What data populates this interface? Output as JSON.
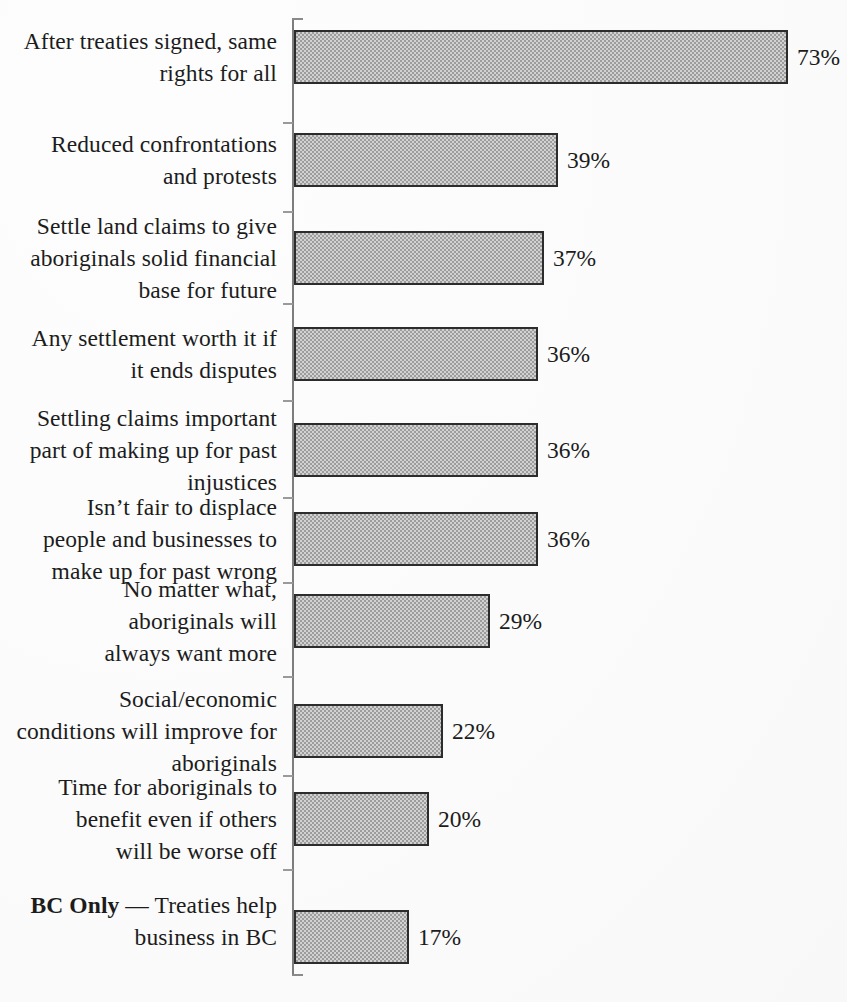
{
  "chart_data": {
    "type": "bar",
    "orientation": "horizontal",
    "title": "",
    "xlabel": "",
    "ylabel": "",
    "xlim": [
      0,
      80
    ],
    "grid": false,
    "legend": false,
    "value_suffix": "%",
    "categories": [
      "After treaties signed, same rights for all",
      "Reduced confrontations and protests",
      "Settle land claims to give aboriginals solid financial base for future",
      "Any settlement worth it if it ends disputes",
      "Settling claims important part of making up for past injustices",
      "Isn’t fair to displace people and businesses to make up for past wrong",
      "No matter what, aboriginals will always want more",
      "Social/economic conditions will improve for aboriginals",
      "Time for aboriginals to benefit even if others will be worse off",
      "BC Only — Treaties help business in BC"
    ],
    "values": [
      73,
      39,
      37,
      36,
      36,
      36,
      29,
      22,
      20,
      17
    ],
    "value_labels": [
      "73%",
      "39%",
      "37%",
      "36%",
      "36%",
      "36%",
      "29%",
      "22%",
      "20%",
      "17%"
    ]
  },
  "rows": [
    {
      "lines": [
        "After treaties signed, same",
        "rights for all"
      ],
      "bold_prefix": "",
      "value": 73,
      "value_label": "73%"
    },
    {
      "lines": [
        "Reduced confrontations",
        "and protests"
      ],
      "bold_prefix": "",
      "value": 39,
      "value_label": "39%"
    },
    {
      "lines": [
        "Settle land claims to give",
        "aboriginals solid financial",
        "base for future"
      ],
      "bold_prefix": "",
      "value": 37,
      "value_label": "37%"
    },
    {
      "lines": [
        "Any settlement worth it if",
        "it ends disputes"
      ],
      "bold_prefix": "",
      "value": 36,
      "value_label": "36%"
    },
    {
      "lines": [
        "Settling claims important",
        "part of making up for past",
        "injustices"
      ],
      "bold_prefix": "",
      "value": 36,
      "value_label": "36%"
    },
    {
      "lines": [
        "Isn’t fair to displace",
        "people and businesses to",
        "make up for past wrong"
      ],
      "bold_prefix": "",
      "value": 36,
      "value_label": "36%"
    },
    {
      "lines": [
        "No matter what,",
        "aboriginals will",
        "always want more"
      ],
      "bold_prefix": "",
      "value": 29,
      "value_label": "29%"
    },
    {
      "lines": [
        "Social/economic",
        "conditions will improve for",
        "aboriginals"
      ],
      "bold_prefix": "",
      "value": 22,
      "value_label": "22%"
    },
    {
      "lines": [
        "Time for aboriginals to",
        "benefit even if others",
        "will be worse off"
      ],
      "bold_prefix": "",
      "value": 20,
      "value_label": "20%"
    },
    {
      "lines": [
        "BC Only",
        " — Treaties help",
        "business in BC"
      ],
      "bold_prefix": "BC Only",
      "value": 17,
      "value_label": "17%"
    }
  ],
  "geometry": {
    "axis_x": 293,
    "axis_top": 18,
    "axis_bottom": 976,
    "px_per_percent": 6.77,
    "bar_height": 54,
    "row_tops": [
      30,
      133,
      231,
      327,
      423,
      512,
      594,
      704,
      792,
      910
    ],
    "tick_ys": [
      18,
      122,
      211,
      303,
      400,
      497,
      582,
      676,
      775,
      869,
      974
    ]
  },
  "colors": {
    "bar_fill": "#9c9c9c",
    "bar_border": "#2c2c2c",
    "axis": "#7d7d7d",
    "text": "#1c1c1c",
    "background": "#fbfbfb"
  }
}
